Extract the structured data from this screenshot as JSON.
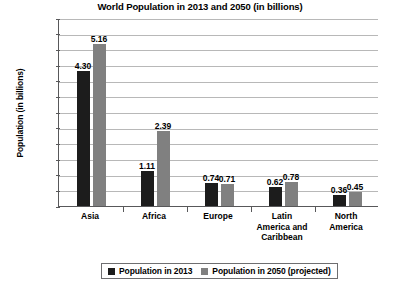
{
  "chart_data": {
    "type": "bar",
    "title": "World Population in 2013 and 2050 (in billions)",
    "xlabel": "",
    "ylabel": "Population (in billions)",
    "ylim": [
      0,
      6.0
    ],
    "ytick_labels": [
      "6.0",
      "5.5",
      "5.0",
      "4.5",
      "4.0",
      "3.5",
      "3.0",
      "2.5",
      "2.0",
      "1.5",
      "1.0",
      "0.5",
      "0"
    ],
    "ytick_values": [
      6.0,
      5.5,
      5.0,
      4.5,
      4.0,
      3.5,
      3.0,
      2.5,
      2.0,
      1.5,
      1.0,
      0.5,
      0
    ],
    "grid": true,
    "legend_position": "bottom",
    "categories": [
      "Asia",
      "Africa",
      "Europe",
      "Latin America and Caribbean",
      "North America"
    ],
    "category_lines": [
      [
        "Asia"
      ],
      [
        "Africa"
      ],
      [
        "Europe"
      ],
      [
        "Latin",
        "America and",
        "Caribbean"
      ],
      [
        "North",
        "America"
      ]
    ],
    "series": [
      {
        "name": "Population in 2013",
        "color": "#1c1c1c",
        "values": [
          4.3,
          1.11,
          0.74,
          0.62,
          0.36
        ],
        "labels": [
          "4.30",
          "1.11",
          "0.74",
          "0.62",
          "0.36"
        ]
      },
      {
        "name": "Population in 2050 (projected)",
        "color": "#808080",
        "values": [
          5.16,
          2.39,
          0.71,
          0.78,
          0.45
        ],
        "labels": [
          "5.16",
          "2.39",
          "0.71",
          "0.78",
          "0.45"
        ]
      }
    ]
  },
  "legend": {
    "items": [
      {
        "label": "Population in 2013",
        "color": "#1c1c1c"
      },
      {
        "label": "Population in 2050 (projected)",
        "color": "#808080"
      }
    ]
  }
}
